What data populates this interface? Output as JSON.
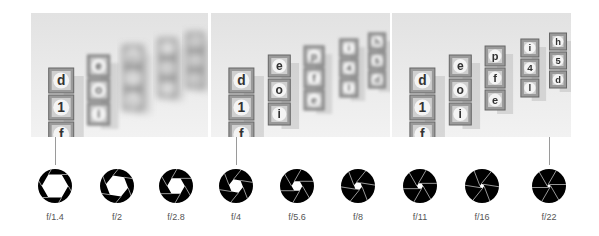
{
  "photos": [
    {
      "id": "photo-wide",
      "aperture": "f/1.4",
      "blur": 2.2,
      "x": 31,
      "width": 177,
      "blocks": [
        [
          "d",
          "1",
          "f"
        ],
        [
          "e",
          "o",
          "i"
        ],
        [
          "p",
          "f",
          "e"
        ],
        [
          "i",
          "4",
          "l"
        ],
        [
          "h",
          "5",
          "d"
        ]
      ]
    },
    {
      "id": "photo-mid",
      "aperture": "f/4",
      "blur": 0.9,
      "x": 211,
      "width": 179,
      "blocks": [
        [
          "d",
          "1",
          "f"
        ],
        [
          "e",
          "o",
          "i"
        ],
        [
          "p",
          "f",
          "e"
        ],
        [
          "i",
          "4",
          "l"
        ],
        [
          "h",
          "5",
          "d"
        ]
      ]
    },
    {
      "id": "photo-narrow",
      "aperture": "f/22",
      "blur": 0.2,
      "x": 392,
      "width": 179,
      "blocks": [
        [
          "d",
          "1",
          "f"
        ],
        [
          "e",
          "o",
          "i"
        ],
        [
          "p",
          "f",
          "e"
        ],
        [
          "i",
          "4",
          "l"
        ],
        [
          "h",
          "5",
          "d"
        ]
      ]
    }
  ],
  "apertures": [
    {
      "label": "f/1.4",
      "cx": 55,
      "hole": 0.78
    },
    {
      "label": "f/2",
      "cx": 117,
      "hole": 0.66
    },
    {
      "label": "f/2.8",
      "cx": 176,
      "hole": 0.52
    },
    {
      "label": "f/4",
      "cx": 236,
      "hole": 0.42
    },
    {
      "label": "f/5.6",
      "cx": 297,
      "hole": 0.32
    },
    {
      "label": "f/8",
      "cx": 358,
      "hole": 0.24
    },
    {
      "label": "f/11",
      "cx": 420,
      "hole": 0.18
    },
    {
      "label": "f/16",
      "cx": 482,
      "hole": 0.13
    },
    {
      "label": "f/22",
      "cx": 549,
      "hole": 0.1
    }
  ],
  "connectors": [
    {
      "from": "photo-wide",
      "to": "f/1.4",
      "x": 55
    },
    {
      "from": "photo-mid",
      "to": "f/4",
      "x": 236
    },
    {
      "from": "photo-narrow",
      "to": "f/22",
      "x": 549
    }
  ],
  "colors": {
    "iris": "#000000",
    "blade_line": "#ffffff",
    "label": "#555555",
    "connector": "#9a9a9a"
  }
}
